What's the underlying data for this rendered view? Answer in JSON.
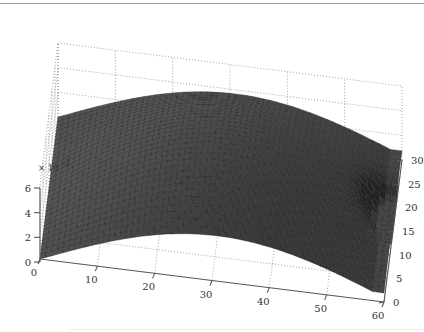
{
  "chart_data": {
    "type": "surface",
    "title": "",
    "xlabel": "",
    "ylabel": "",
    "zlabel": "",
    "x_ticks": [
      0,
      10,
      20,
      30,
      40,
      50,
      60
    ],
    "y_ticks": [
      0,
      5,
      10,
      15,
      20,
      25,
      30
    ],
    "z_ticks": [
      0,
      2,
      4,
      6
    ],
    "z_tick_labels": [
      "0",
      "2",
      "4",
      "6"
    ],
    "z_scale_label": "× 10⁻³",
    "xlim": [
      0,
      60
    ],
    "ylim": [
      0,
      30
    ],
    "zlim": [
      0,
      0.006
    ],
    "grid": true,
    "grid_style": "dotted",
    "colormap": "gray",
    "mesh": "faceted surface",
    "peak": {
      "x": 30,
      "y": 15,
      "z": 0.0058
    }
  },
  "axes": {
    "x_labels": [
      "0",
      "10",
      "20",
      "30",
      "40",
      "50",
      "60"
    ],
    "y_labels": [
      "0",
      "5",
      "10",
      "15",
      "20",
      "25",
      "30"
    ],
    "z_labels": [
      "0",
      "2",
      "4",
      "6"
    ],
    "z_exponent": "× 10",
    "z_exponent_power": "-3"
  }
}
